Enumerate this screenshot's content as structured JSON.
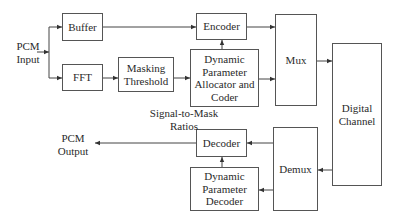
{
  "diagram": {
    "type": "block-diagram",
    "blocks": {
      "buffer": "Buffer",
      "fft": "FFT",
      "masking_threshold": "Masking Threshold",
      "encoder": "Encoder",
      "allocator": "Dynamic Parameter Allocator and Coder",
      "mux": "Mux",
      "digital_channel": "Digital Channel",
      "demux": "Demux",
      "decoder": "Decoder",
      "param_decoder": "Dynamic Parameter Decoder"
    },
    "labels": {
      "pcm_input_line1": "PCM",
      "pcm_input_line2": "Input",
      "pcm_output_line1": "PCM",
      "pcm_output_line2": "Output",
      "smr_line1": "Signal-to-Mask",
      "smr_line2": "Ratios"
    },
    "blocks_multiline": {
      "masking_1": "Masking",
      "masking_2": "Threshold",
      "alloc_1": "Dynamic",
      "alloc_2": "Parameter",
      "alloc_3": "Allocator and",
      "alloc_4": "Coder",
      "channel_1": "Digital",
      "channel_2": "Channel",
      "pdec_1": "Dynamic",
      "pdec_2": "Parameter",
      "pdec_3": "Decoder"
    },
    "edges": [
      [
        "PCM Input",
        "Buffer"
      ],
      [
        "PCM Input",
        "FFT"
      ],
      [
        "Buffer",
        "Encoder"
      ],
      [
        "FFT",
        "Masking Threshold"
      ],
      [
        "Masking Threshold",
        "Dynamic Parameter Allocator and Coder"
      ],
      [
        "Dynamic Parameter Allocator and Coder",
        "Encoder"
      ],
      [
        "Encoder",
        "Mux"
      ],
      [
        "Dynamic Parameter Allocator and Coder",
        "Mux"
      ],
      [
        "Mux",
        "Digital Channel"
      ],
      [
        "Digital Channel",
        "Demux"
      ],
      [
        "Demux",
        "Decoder"
      ],
      [
        "Demux",
        "Dynamic Parameter Decoder"
      ],
      [
        "Dynamic Parameter Decoder",
        "Decoder"
      ],
      [
        "Decoder",
        "PCM Output"
      ]
    ]
  }
}
